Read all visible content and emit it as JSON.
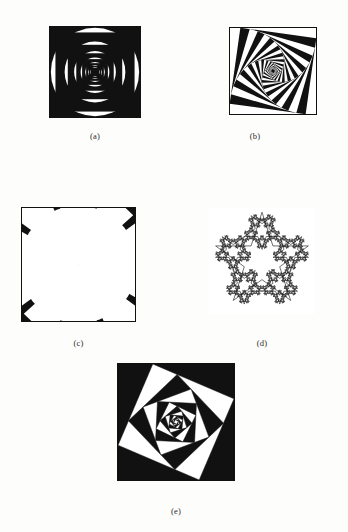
{
  "page": {
    "background_color": "#fdfdfc",
    "ink_color": "#111111"
  },
  "figures": [
    {
      "id": "a",
      "caption": "(a)",
      "name": "nested-circles-and-squares",
      "description": "Alternating black and white concentric circles inscribed in concentric squares, repeating inward",
      "size": 92,
      "levels": 7,
      "scale_ratio": 0.62,
      "rotation_step": 0,
      "fill_style": "alternating-black-white",
      "border": true
    },
    {
      "id": "b",
      "caption": "(b)",
      "name": "rotating-nested-squares",
      "description": "Concentric squares each rotated and scaled inward producing a lens shape at the centre",
      "size": 88,
      "levels": 13,
      "scale_ratio": 0.885,
      "rotation_step": 8,
      "fill_style": "alternating-black-white",
      "border": true
    },
    {
      "id": "c",
      "caption": "(c)",
      "name": "spiral-wedge-vortex",
      "description": "Square frame filled with radiating wedges twisting into a vortex at the centre",
      "size": 115,
      "levels": 13,
      "scale_ratio": 0.8,
      "rotation_step": 12,
      "wedges": 20,
      "fill_style": "alternating-black-white",
      "border": true
    },
    {
      "id": "d",
      "caption": "(d)",
      "name": "recursive-star-fractal",
      "description": "Five-pointed star outline with smaller stars recursively placed at each vertex",
      "size": 106,
      "levels": 4,
      "scale_ratio": 0.382,
      "points": 5,
      "fill_style": "outline-only",
      "border": false
    },
    {
      "id": "e",
      "caption": "(e)",
      "name": "square-spiral-whirl",
      "description": "Square repeatedly inset by connecting a point along each edge, producing a black whirling spiral",
      "size": 118,
      "levels": 9,
      "scale_ratio": 0.82,
      "rotation_step": 22,
      "fill_style": "alternating-black-white",
      "border": true
    }
  ]
}
